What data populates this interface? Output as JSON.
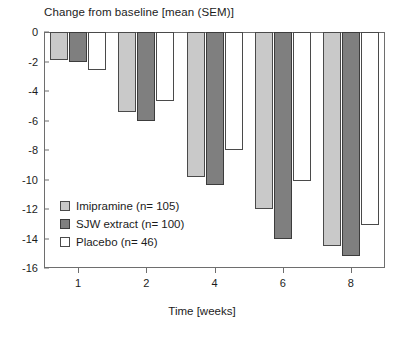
{
  "chart_data": {
    "type": "bar",
    "title": "Change from baseline [mean (SEM)]",
    "xlabel": "Time [weeks]",
    "ylabel": "",
    "categories": [
      "1",
      "2",
      "4",
      "6",
      "8"
    ],
    "series": [
      {
        "name": "Imipramine (n= 105)",
        "color": "#c9c9c9",
        "values": [
          -1.9,
          -5.4,
          -9.8,
          -12.0,
          -14.5
        ]
      },
      {
        "name": "SJW extract (n= 100)",
        "color": "#7f7f7f",
        "values": [
          -2.0,
          -6.0,
          -10.4,
          -14.0,
          -15.2
        ]
      },
      {
        "name": "Placebo (n= 46)",
        "color": "#ffffff",
        "values": [
          -2.6,
          -4.7,
          -8.0,
          -10.1,
          -13.1
        ]
      }
    ],
    "ylim": [
      -16,
      0
    ],
    "ytick_labels": [
      "0",
      "-2",
      "-4",
      "-6",
      "-8",
      "-10",
      "-12",
      "-14",
      "-16"
    ],
    "ytick_values": [
      0,
      -2,
      -4,
      -6,
      -8,
      -10,
      -12,
      -14,
      -16
    ],
    "grid": false,
    "legend_position": "inside-lower-left"
  },
  "legend": {
    "entries": [
      "Imipramine (n= 105)",
      "SJW extract (n= 100)",
      "Placebo (n= 46)"
    ]
  }
}
